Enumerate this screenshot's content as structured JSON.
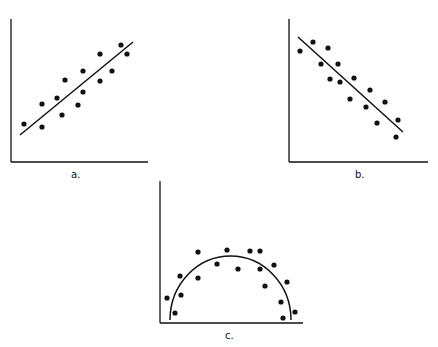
{
  "colors": {
    "ink": "#111111",
    "background": "#ffffff"
  },
  "panels": [
    {
      "id": "a",
      "label": "a.",
      "pattern": "positive linear correlation"
    },
    {
      "id": "b",
      "label": "b.",
      "pattern": "negative linear correlation"
    },
    {
      "id": "c",
      "label": "c.",
      "pattern": "curvilinear (inverted U) relationship"
    }
  ],
  "chart_data": [
    {
      "type": "scatter",
      "title": "a.",
      "xlabel": "",
      "ylabel": "",
      "axes": {
        "origin": [
          11,
          162
        ],
        "x_end": 148,
        "y_top": 19
      },
      "fit": {
        "kind": "line",
        "from": [
          20,
          135
        ],
        "to": [
          133,
          42
        ]
      },
      "points": [
        [
          24,
          124
        ],
        [
          42,
          127
        ],
        [
          42,
          104
        ],
        [
          57,
          98
        ],
        [
          62,
          115
        ],
        [
          65,
          80
        ],
        [
          78,
          105
        ],
        [
          83,
          92
        ],
        [
          83,
          71
        ],
        [
          100,
          81
        ],
        [
          100,
          54
        ],
        [
          112,
          71
        ],
        [
          121,
          45
        ],
        [
          127,
          54
        ]
      ],
      "label_pos": [
        71,
        176
      ]
    },
    {
      "type": "scatter",
      "title": "b.",
      "xlabel": "",
      "ylabel": "",
      "axes": {
        "origin": [
          289,
          162
        ],
        "x_end": 428,
        "y_top": 19
      },
      "fit": {
        "kind": "line",
        "from": [
          298,
          37
        ],
        "to": [
          403,
          132
        ]
      },
      "points": [
        [
          300,
          51
        ],
        [
          313,
          42
        ],
        [
          321,
          64
        ],
        [
          328,
          48
        ],
        [
          330,
          79
        ],
        [
          338,
          64
        ],
        [
          340,
          82
        ],
        [
          350,
          99
        ],
        [
          354,
          78
        ],
        [
          370,
          90
        ],
        [
          366,
          107
        ],
        [
          385,
          102
        ],
        [
          377,
          123
        ],
        [
          398,
          120
        ],
        [
          396,
          137
        ]
      ],
      "label_pos": [
        355,
        176
      ]
    },
    {
      "type": "scatter",
      "title": "c.",
      "xlabel": "",
      "ylabel": "",
      "axes": {
        "origin": [
          160,
          323
        ],
        "x_end": 303,
        "y_top": 181
      },
      "fit": {
        "kind": "arc",
        "from": [
          170,
          320
        ],
        "peak": [
          229,
          256
        ],
        "to": [
          291,
          320
        ]
      },
      "points": [
        [
          167,
          298
        ],
        [
          175,
          313
        ],
        [
          180,
          276
        ],
        [
          181,
          295
        ],
        [
          198,
          252
        ],
        [
          198,
          278
        ],
        [
          217,
          264
        ],
        [
          227,
          250
        ],
        [
          238,
          269
        ],
        [
          250,
          251
        ],
        [
          260,
          251
        ],
        [
          260,
          269
        ],
        [
          274,
          265
        ],
        [
          265,
          286
        ],
        [
          287,
          282
        ],
        [
          281,
          302
        ],
        [
          295,
          312
        ],
        [
          283,
          318
        ]
      ],
      "label_pos": [
        225,
        337
      ]
    }
  ]
}
